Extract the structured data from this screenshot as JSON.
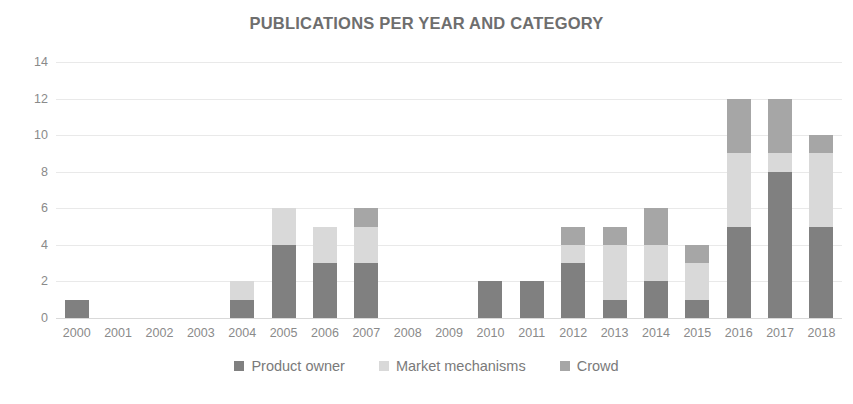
{
  "chart_data": {
    "type": "bar",
    "stacked": true,
    "title": "PUBLICATIONS PER YEAR AND CATEGORY",
    "xlabel": "",
    "ylabel": "",
    "ylim": [
      0,
      14
    ],
    "yticks": [
      0,
      2,
      4,
      6,
      8,
      10,
      12,
      14
    ],
    "grid": true,
    "legend_position": "bottom",
    "categories": [
      "2000",
      "2001",
      "2002",
      "2003",
      "2004",
      "2005",
      "2006",
      "2007",
      "2008",
      "2009",
      "2010",
      "2011",
      "2012",
      "2013",
      "2014",
      "2015",
      "2016",
      "2017",
      "2018"
    ],
    "series": [
      {
        "name": "Product owner",
        "color": "#808080",
        "values": [
          1,
          0,
          0,
          0,
          1,
          4,
          3,
          3,
          0,
          0,
          2,
          2,
          3,
          1,
          2,
          1,
          5,
          8,
          5
        ]
      },
      {
        "name": "Market mechanisms",
        "color": "#d9d9d9",
        "values": [
          0,
          0,
          0,
          0,
          1,
          2,
          2,
          2,
          0,
          0,
          0,
          0,
          1,
          3,
          2,
          2,
          4,
          1,
          4
        ]
      },
      {
        "name": "Crowd",
        "color": "#a6a6a6",
        "values": [
          0,
          0,
          0,
          0,
          0,
          0,
          0,
          1,
          0,
          0,
          0,
          0,
          1,
          1,
          2,
          1,
          3,
          3,
          1
        ]
      }
    ],
    "totals": [
      1,
      0,
      0,
      0,
      2,
      6,
      5,
      6,
      0,
      0,
      2,
      2,
      5,
      5,
      6,
      4,
      12,
      12,
      10
    ]
  },
  "colors": {
    "background": "#ffffff",
    "title": "#6e6e6e",
    "tick_label": "#8a8a8a",
    "gridline": "#e9e9e9",
    "legend_text": "#7a7a7a"
  }
}
